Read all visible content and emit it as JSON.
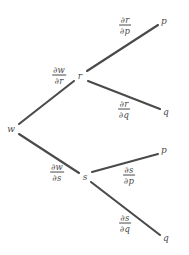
{
  "diagram": {
    "type": "dependency-tree",
    "stroke_color": "#4a4a4a",
    "background_color": "#ffffff",
    "top_crop_remnant": "",
    "nodes": [
      {
        "id": "w",
        "label": "w",
        "x": 11,
        "y": 129
      },
      {
        "id": "r",
        "label": "r",
        "x": 80,
        "y": 76
      },
      {
        "id": "s",
        "label": "s",
        "x": 85,
        "y": 177
      },
      {
        "id": "p1",
        "label": "p",
        "x": 164,
        "y": 21
      },
      {
        "id": "q1",
        "label": "q",
        "x": 166,
        "y": 112
      },
      {
        "id": "p2",
        "label": "p",
        "x": 164,
        "y": 150
      },
      {
        "id": "q2",
        "label": "q",
        "x": 166,
        "y": 238
      }
    ],
    "edges": [
      {
        "id": "w-r",
        "from": "w",
        "to": "r",
        "x1": 19,
        "y1": 124,
        "x2": 74,
        "y2": 81
      },
      {
        "id": "w-s",
        "from": "w",
        "to": "s",
        "x1": 19,
        "y1": 134,
        "x2": 79,
        "y2": 173
      },
      {
        "id": "r-p1",
        "from": "r",
        "to": "p1",
        "x1": 87,
        "y1": 71,
        "x2": 158,
        "y2": 25
      },
      {
        "id": "r-q1",
        "from": "r",
        "to": "q1",
        "x1": 88,
        "y1": 81,
        "x2": 160,
        "y2": 109
      },
      {
        "id": "s-p2",
        "from": "s",
        "to": "p2",
        "x1": 92,
        "y1": 172,
        "x2": 158,
        "y2": 154
      },
      {
        "id": "s-q2",
        "from": "s",
        "to": "q2",
        "x1": 91,
        "y1": 182,
        "x2": 160,
        "y2": 235
      }
    ],
    "edge_labels": [
      {
        "id": "dw-dr",
        "edge": "w-r",
        "numerator": "∂w",
        "denominator": "∂r",
        "x": 59,
        "y": 76
      },
      {
        "id": "dw-ds",
        "edge": "w-s",
        "numerator": "∂w",
        "denominator": "∂s",
        "x": 57,
        "y": 173
      },
      {
        "id": "dr-dp",
        "edge": "r-p1",
        "numerator": "∂r",
        "denominator": "∂p",
        "x": 125,
        "y": 26
      },
      {
        "id": "dr-dq",
        "edge": "r-q1",
        "numerator": "∂r",
        "denominator": "∂q",
        "x": 124,
        "y": 110
      },
      {
        "id": "ds-dp",
        "edge": "s-p2",
        "numerator": "∂s",
        "denominator": "∂p",
        "x": 129,
        "y": 176
      },
      {
        "id": "ds-dq",
        "edge": "s-q2",
        "numerator": "∂s",
        "denominator": "∂q",
        "x": 125,
        "y": 224
      }
    ]
  }
}
